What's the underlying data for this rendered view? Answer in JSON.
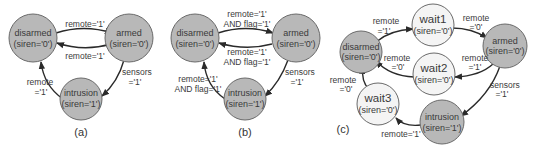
{
  "diagram_a": {
    "caption": "(a)",
    "nodes": {
      "disarmed": {
        "name": "disarmed",
        "output": "(siren='0')"
      },
      "armed": {
        "name": "armed",
        "output": "(siren='0')"
      },
      "intrusion": {
        "name": "intrusion",
        "output": "(siren='1')"
      }
    },
    "edges": {
      "disarmed_to_armed": "remote='1'",
      "armed_to_disarmed": "remote='1'",
      "armed_to_intrusion_1": "sensors",
      "armed_to_intrusion_2": "='1'",
      "intrusion_to_disarmed_1": "remote",
      "intrusion_to_disarmed_2": "='1'"
    }
  },
  "diagram_b": {
    "caption": "(b)",
    "nodes": {
      "disarmed": {
        "name": "disarmed",
        "output": "(siren='0')"
      },
      "armed": {
        "name": "armed",
        "output": "(siren='0')"
      },
      "intrusion": {
        "name": "intrusion",
        "output": "(siren='1')"
      }
    },
    "edges": {
      "disarmed_to_armed_1": "remote='1'",
      "disarmed_to_armed_2": "AND flag='1'",
      "armed_to_disarmed_1": "remote='1'",
      "armed_to_disarmed_2": "AND flag='1'",
      "armed_to_intrusion_1": "sensors",
      "armed_to_intrusion_2": "='1'",
      "intrusion_to_disarmed_1": "remote='1'",
      "intrusion_to_disarmed_2": "AND flag='1'"
    }
  },
  "diagram_c": {
    "caption": "(c)",
    "nodes": {
      "disarmed": {
        "name": "disarmed",
        "output": "(siren='0')"
      },
      "wait1": {
        "name": "wait1",
        "output": "(siren='0')"
      },
      "armed": {
        "name": "armed",
        "output": "(siren='0')"
      },
      "wait2": {
        "name": "wait2",
        "output": "(siren='0')"
      },
      "wait3": {
        "name": "wait3",
        "output": "(siren='0')"
      },
      "intrusion": {
        "name": "intrusion",
        "output": "(siren='1')"
      }
    },
    "edges": {
      "disarmed_to_wait1_1": "remote",
      "disarmed_to_wait1_2": "='1'",
      "wait1_to_armed_1": "remote",
      "wait1_to_armed_2": "='0'",
      "armed_to_wait2_1": "remote",
      "armed_to_wait2_2": "='1'",
      "wait2_to_disarmed_1": "remote",
      "wait2_to_disarmed_2": "='0'",
      "armed_to_intrusion_1": "sensors",
      "armed_to_intrusion_2": "='1'",
      "intrusion_to_wait3": "remote='1'",
      "wait3_to_disarmed_1": "remote",
      "wait3_to_disarmed_2": "='0'"
    }
  },
  "colors": {
    "active_state_fill": "#b8b8b8",
    "wait_state_fill": "#f4f4f4",
    "edge": "#2a2a2a"
  }
}
